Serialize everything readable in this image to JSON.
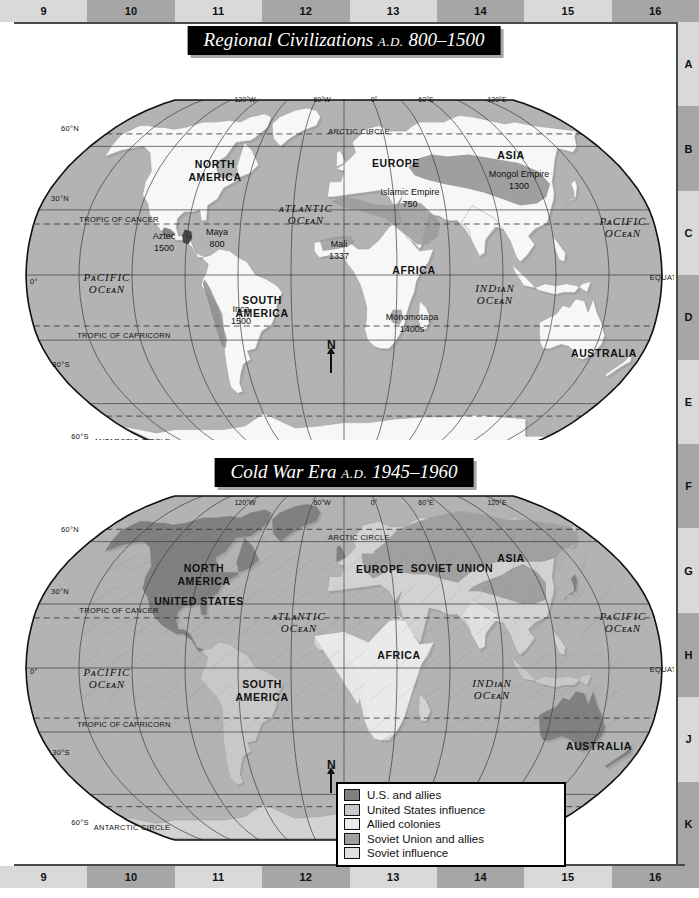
{
  "page": {
    "index_columns": [
      "9",
      "10",
      "11",
      "12",
      "13",
      "14",
      "15",
      "16"
    ],
    "index_rows": [
      "A",
      "B",
      "C",
      "D",
      "E",
      "F",
      "G",
      "H",
      "J",
      "K"
    ]
  },
  "map1": {
    "title_main": "Regional Civilizations",
    "title_era": "A.D.",
    "title_years": "800–1500",
    "north_arrow": "N",
    "labels": [
      {
        "text": "NORTH",
        "x": 201,
        "y": 128,
        "style": "continent"
      },
      {
        "text": "AMERICA",
        "x": 201,
        "y": 141,
        "style": "continent"
      },
      {
        "text": "SOUTH",
        "x": 248,
        "y": 264,
        "style": "continent"
      },
      {
        "text": "AMERICA",
        "x": 248,
        "y": 277,
        "style": "continent"
      },
      {
        "text": "EUROPE",
        "x": 382,
        "y": 127,
        "style": "continent"
      },
      {
        "text": "AFRICA",
        "x": 400,
        "y": 234,
        "style": "continent"
      },
      {
        "text": "ASIA",
        "x": 497,
        "y": 119,
        "style": "continent"
      },
      {
        "text": "AUSTRALIA",
        "x": 590,
        "y": 317,
        "style": "continent"
      },
      {
        "text": "ANTARCTICA",
        "x": 395,
        "y": 424,
        "style": "continent"
      },
      {
        "text": "Aztec",
        "x": 150,
        "y": 199,
        "style": "place"
      },
      {
        "text": "1500",
        "x": 150,
        "y": 211,
        "style": "place"
      },
      {
        "text": "Maya",
        "x": 203,
        "y": 195,
        "style": "place"
      },
      {
        "text": "800",
        "x": 203,
        "y": 207,
        "style": "place"
      },
      {
        "text": "Inca",
        "x": 227,
        "y": 272,
        "style": "place"
      },
      {
        "text": "1500",
        "x": 227,
        "y": 284,
        "style": "place"
      },
      {
        "text": "Mali",
        "x": 325,
        "y": 207,
        "style": "place"
      },
      {
        "text": "1337",
        "x": 325,
        "y": 219,
        "style": "place"
      },
      {
        "text": "Monomotapa",
        "x": 398,
        "y": 280,
        "style": "place"
      },
      {
        "text": "1400s",
        "x": 398,
        "y": 292,
        "style": "place"
      },
      {
        "text": "Islamic Empire",
        "x": 396,
        "y": 155,
        "style": "place"
      },
      {
        "text": "750",
        "x": 396,
        "y": 167,
        "style": "place"
      },
      {
        "text": "Mongol Empire",
        "x": 505,
        "y": 137,
        "style": "place"
      },
      {
        "text": "1300",
        "x": 505,
        "y": 149,
        "style": "place"
      }
    ],
    "ocean_labels": [
      {
        "line1": "ᴀTLᴀNTIC",
        "line2": "OCᴇᴀN",
        "x": 292,
        "y": 172
      },
      {
        "line1": "PᴀCIFIC",
        "line2": "OCᴇᴀN",
        "x": 93,
        "y": 241
      },
      {
        "line1": "PᴀCIFIC",
        "line2": "OCᴇᴀN",
        "x": 609,
        "y": 185
      },
      {
        "line1": "INDɪᴀN",
        "line2": "OCᴇᴀN",
        "x": 481,
        "y": 252
      }
    ],
    "latitude_labels": [
      {
        "text": "ARCTIC CIRCLE",
        "x": 345,
        "y": 94
      },
      {
        "text": "TROPIC OF CANCER",
        "x": 105,
        "y": 182
      },
      {
        "text": "TROPIC OF CAPRICORN",
        "x": 110,
        "y": 298
      },
      {
        "text": "ANTARCTIC CIRCLE",
        "x": 118,
        "y": 404
      },
      {
        "text": "EQUATOR",
        "x": 655,
        "y": 240
      },
      {
        "text": "60°N",
        "x": 56,
        "y": 91
      },
      {
        "text": "30°N",
        "x": 46,
        "y": 161
      },
      {
        "text": "0°",
        "x": 20,
        "y": 244
      },
      {
        "text": "30°S",
        "x": 47,
        "y": 327
      },
      {
        "text": "60°S",
        "x": 66,
        "y": 399
      }
    ],
    "longitude_labels": [
      {
        "text": "120°W",
        "x": 231,
        "y": 62
      },
      {
        "text": "60°W",
        "x": 308,
        "y": 62
      },
      {
        "text": "0°",
        "x": 360,
        "y": 62
      },
      {
        "text": "60°E",
        "x": 412,
        "y": 62
      },
      {
        "text": "120°E",
        "x": 483,
        "y": 62
      }
    ]
  },
  "map2": {
    "title_main": "Cold War Era",
    "title_era": "A.D.",
    "title_years": "1945–1960",
    "north_arrow": "N",
    "labels": [
      {
        "text": "NORTH",
        "x": 190,
        "y": 100,
        "style": "continent"
      },
      {
        "text": "AMERICA",
        "x": 190,
        "y": 113,
        "style": "continent"
      },
      {
        "text": "UNITED STATES",
        "x": 185,
        "y": 133,
        "style": "continent"
      },
      {
        "text": "SOUTH",
        "x": 248,
        "y": 216,
        "style": "continent"
      },
      {
        "text": "AMERICA",
        "x": 248,
        "y": 229,
        "style": "continent"
      },
      {
        "text": "EUROPE",
        "x": 366,
        "y": 101,
        "style": "continent"
      },
      {
        "text": "SOVIET UNION",
        "x": 438,
        "y": 100,
        "style": "continent"
      },
      {
        "text": "ASIA",
        "x": 497,
        "y": 90,
        "style": "continent"
      },
      {
        "text": "AFRICA",
        "x": 385,
        "y": 187,
        "style": "continent"
      },
      {
        "text": "AUSTRALIA",
        "x": 585,
        "y": 278,
        "style": "continent"
      },
      {
        "text": "ANTARCTICA",
        "x": 398,
        "y": 379,
        "style": "continent"
      }
    ],
    "ocean_labels": [
      {
        "line1": "ᴀTLᴀNTIC",
        "line2": "OCᴇᴀN",
        "x": 285,
        "y": 148
      },
      {
        "line1": "PᴀCIFIC",
        "line2": "OCᴇᴀN",
        "x": 93,
        "y": 204
      },
      {
        "line1": "PᴀCIFIC",
        "line2": "OCᴇᴀN",
        "x": 609,
        "y": 148
      },
      {
        "line1": "INDɪᴀN",
        "line2": "OCᴇᴀN",
        "x": 478,
        "y": 215
      }
    ],
    "latitude_labels": [
      {
        "text": "ARCTIC CIRCLE",
        "x": 345,
        "y": 68
      },
      {
        "text": "TROPIC OF CANCER",
        "x": 105,
        "y": 141
      },
      {
        "text": "TROPIC OF CAPRICORN",
        "x": 110,
        "y": 255
      },
      {
        "text": "ANTARCTIC CIRCLE",
        "x": 118,
        "y": 358
      },
      {
        "text": "EQUATOR",
        "x": 655,
        "y": 200
      },
      {
        "text": "60°N",
        "x": 56,
        "y": 60
      },
      {
        "text": "30°N",
        "x": 46,
        "y": 122
      },
      {
        "text": "0°",
        "x": 20,
        "y": 202
      },
      {
        "text": "30°S",
        "x": 47,
        "y": 283
      },
      {
        "text": "60°S",
        "x": 66,
        "y": 353
      }
    ],
    "longitude_labels": [
      {
        "text": "120°W",
        "x": 231,
        "y": 33
      },
      {
        "text": "60°W",
        "x": 308,
        "y": 33
      },
      {
        "text": "0°",
        "x": 360,
        "y": 33
      },
      {
        "text": "60°E",
        "x": 412,
        "y": 33
      },
      {
        "text": "120°E",
        "x": 483,
        "y": 33
      }
    ],
    "legend": {
      "items": [
        {
          "label": "U.S. and allies",
          "color": "#808080"
        },
        {
          "label": "United States influence",
          "color": "#c8c8c8"
        },
        {
          "label": "Allied colonies",
          "color": "#ececec"
        },
        {
          "label": "Soviet Union and allies",
          "color": "#a0a0a0"
        },
        {
          "label": "Soviet influence",
          "color": "#e0e0e0"
        }
      ]
    }
  },
  "colors": {
    "ocean": "#b3b3b3",
    "land": "#f7f7f7",
    "empire_shade": "#8f8f8f",
    "band_dark": "#a6a6a6",
    "band_light": "#d9d9d9",
    "title_bg": "#000000",
    "title_fg": "#ffffff"
  }
}
